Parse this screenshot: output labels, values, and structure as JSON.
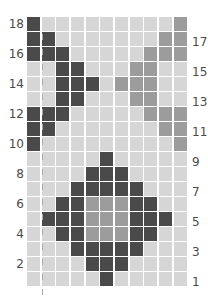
{
  "chart_data": {
    "type": "table",
    "title": "",
    "columns": 11,
    "rows": 18,
    "colors": {
      "dark": "#4a4a4a",
      "mid": "#9c9c9c",
      "light": "#d6d6d6",
      "background": "#ffffff",
      "label": "#4a4a4a",
      "guide_line": "#a8a8a8"
    },
    "legend": {
      "D": "dark",
      "M": "mid-grey",
      "L": "light"
    },
    "grid_top_to_bottom": [
      {
        "row": 18,
        "cells": "DLLLLLLLLLM"
      },
      {
        "row": 17,
        "cells": "DDLLLLLLLMM"
      },
      {
        "row": 16,
        "cells": "DDDLLLLLMMM"
      },
      {
        "row": 15,
        "cells": "LLDDLLLMMLL"
      },
      {
        "row": 14,
        "cells": "LLDDDLMMMLL"
      },
      {
        "row": 13,
        "cells": "LLDDLLLMMLL"
      },
      {
        "row": 12,
        "cells": "DDDLLLLLMMM"
      },
      {
        "row": 11,
        "cells": "DDLLLLLLLMM"
      },
      {
        "row": 10,
        "cells": "DLLLLLLLLLM"
      },
      {
        "row": 9,
        "cells": "LLLLLDLLLLL"
      },
      {
        "row": 8,
        "cells": "LLLLDDDLLLL"
      },
      {
        "row": 7,
        "cells": "LLLDDDDDLLL"
      },
      {
        "row": 6,
        "cells": "LLDDMMMDDLL"
      },
      {
        "row": 5,
        "cells": "LDDDMMMDDDL"
      },
      {
        "row": 4,
        "cells": "LLDDMMMDDLL"
      },
      {
        "row": 3,
        "cells": "LLLDDDDDLLL"
      },
      {
        "row": 2,
        "cells": "LLLLDDDLLLL"
      },
      {
        "row": 1,
        "cells": "LLLLLDLLLLL"
      }
    ],
    "left_row_labels": [
      "18",
      "16",
      "14",
      "12",
      "10",
      "8",
      "6",
      "4",
      "2"
    ],
    "right_row_labels": [
      "17",
      "15",
      "13",
      "11",
      "9",
      "7",
      "5",
      "3",
      "1"
    ],
    "guide_line": "dashed vertical line between column 1 and column 2"
  }
}
